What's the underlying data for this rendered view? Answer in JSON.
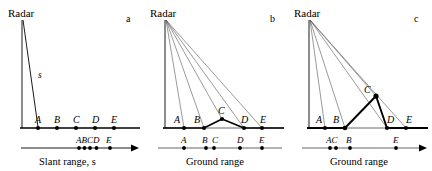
{
  "figure": {
    "title": "",
    "panels": [
      {
        "id": "a",
        "letter": "a",
        "radar_label": "Radar",
        "axis_label_prefix": "Slant range, ",
        "axis_label_italic": "s",
        "axis_label_full": "Slant range, s",
        "ray_label": "s",
        "ground_points": [
          "A",
          "B",
          "C",
          "D",
          "E"
        ],
        "range_points": [
          "A",
          "B",
          "C",
          "D",
          "E"
        ],
        "range_label_group1": "ABCD",
        "range_label_group2": "E",
        "description": "Single slant ray from radar to flat ground; points A-E evenly spaced on ground, compressed as ABCD E on slant range axis"
      },
      {
        "id": "b",
        "letter": "b",
        "radar_label": "Radar",
        "axis_label_full": "Ground range",
        "ground_points": [
          "A",
          "B",
          "C",
          "D",
          "E"
        ],
        "range_points": [
          "A",
          "B",
          "C",
          "D",
          "E"
        ],
        "range_label_group1": "A",
        "range_label_group2": "B",
        "range_label_group3": "C",
        "range_label_group4": "D",
        "range_label_group5": "E",
        "description": "Five rays from radar to terrain with gentle hill at C; ground range shows B and C close together (foreshortening)"
      },
      {
        "id": "c",
        "letter": "c",
        "radar_label": "Radar",
        "axis_label_full": "Ground range",
        "ground_points": [
          "A",
          "B",
          "C",
          "D",
          "E"
        ],
        "range_points": [
          "A",
          "C",
          "B",
          "E"
        ],
        "range_label_group1": "AC",
        "range_label_group2": "B",
        "range_label_group3": "E",
        "description": "Rays from radar to terrain with steep peak at C; ground range shows A and C overlapping ahead of B (layover)"
      }
    ]
  },
  "colors": {
    "ink": "#000000",
    "ray": "#555555",
    "axis": "#666666",
    "background": "#ffffff"
  }
}
